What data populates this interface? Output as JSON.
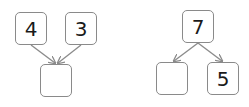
{
  "diagrams": [
    {
      "type": "join",
      "top": [
        {
          "value": "4"
        },
        {
          "value": "3"
        }
      ],
      "bottom": {
        "value": ""
      }
    },
    {
      "type": "split",
      "top": {
        "value": "7"
      },
      "bottom": [
        {
          "value": ""
        },
        {
          "value": "5"
        }
      ]
    }
  ],
  "colors": {
    "border": "#8a8a8a",
    "arrow": "#8a8a8a",
    "text": "#1a1a1a"
  }
}
